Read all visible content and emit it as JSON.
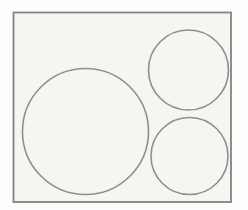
{
  "figure": {
    "canvas": {
      "width": 248,
      "height": 210
    },
    "colors": {
      "page_background": "#fdfdfc",
      "paper_fill": "#f6f5f2",
      "rect_stroke": "#828282",
      "circle_stroke": "#8f8f8f"
    },
    "shapes": {
      "rectangle": {
        "name": "bounding-rectangle",
        "x": 13.5,
        "y": 12.5,
        "width": 217.5,
        "height": 189.5,
        "stroke_width": 1.8
      },
      "circles": [
        {
          "name": "large-circle-left",
          "cx": 85.5,
          "cy": 131.5,
          "r": 63,
          "stroke_width": 1.6
        },
        {
          "name": "small-circle-top-right",
          "cx": 188.5,
          "cy": 70,
          "r": 40,
          "stroke_width": 1.6
        },
        {
          "name": "small-circle-bottom-right",
          "cx": 189.5,
          "cy": 156,
          "r": 38.5,
          "stroke_width": 1.6
        }
      ]
    }
  }
}
